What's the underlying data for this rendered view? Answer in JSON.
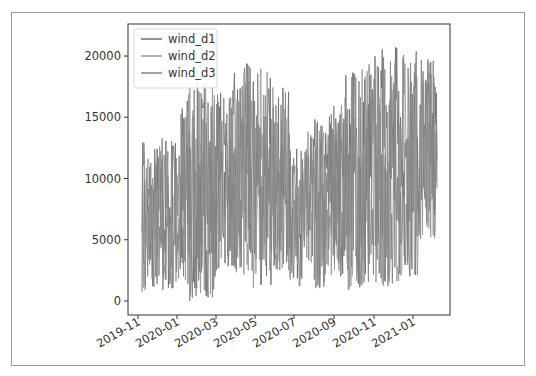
{
  "chart_data": {
    "type": "line",
    "title": "",
    "xlabel": "",
    "ylabel": "",
    "ylim": [
      -1100,
      22600
    ],
    "yticks": [
      0,
      5000,
      10000,
      15000,
      20000
    ],
    "ytick_labels": [
      "0",
      "5000",
      "10000",
      "15000",
      "20000"
    ],
    "xtick_labels": [
      "2019-11",
      "2020-01",
      "2020-03",
      "2020-05",
      "2020-07",
      "2020-09",
      "2020-11",
      "2021-01"
    ],
    "x_range": [
      "2019-11-05",
      "2021-02-15"
    ],
    "grid": false,
    "legend_position": "upper left",
    "legend": [
      "wind_d1",
      "wind_d2",
      "wind_d3"
    ],
    "series": [
      {
        "name": "wind_d1",
        "color": "#6f6f6f"
      },
      {
        "name": "wind_d2",
        "color": "#9a9a9a"
      },
      {
        "name": "wind_d3",
        "color": "#858585"
      }
    ],
    "approx_envelope": {
      "note": "daily values oscillating strongly; approximate local min/max by month",
      "months": [
        "2019-11",
        "2019-12",
        "2020-01",
        "2020-02",
        "2020-03",
        "2020-04",
        "2020-05",
        "2020-06",
        "2020-07",
        "2020-08",
        "2020-09",
        "2020-10",
        "2020-11",
        "2020-12",
        "2021-01",
        "2021-02"
      ],
      "min": [
        700,
        500,
        0,
        300,
        2500,
        2000,
        1000,
        2500,
        1200,
        1000,
        2000,
        800,
        1500,
        1200,
        2000,
        5000
      ],
      "max": [
        13500,
        14000,
        17500,
        18000,
        17500,
        19500,
        19000,
        17500,
        12500,
        15000,
        16500,
        19500,
        20000,
        21500,
        20500,
        20000
      ]
    }
  },
  "legend": {
    "items": [
      {
        "label": "wind_d1"
      },
      {
        "label": "wind_d2"
      },
      {
        "label": "wind_d3"
      }
    ]
  }
}
